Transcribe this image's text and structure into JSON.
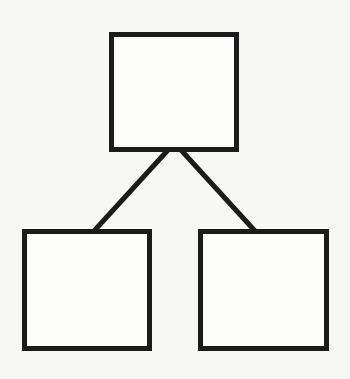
{
  "diagram": {
    "type": "tree",
    "width": 350,
    "height": 379,
    "background": "#f7f7f5",
    "stroke_color": "#1b1b1b",
    "fill_color": "#fdfdfc",
    "stroke_width": 5,
    "nodes": [
      {
        "id": "root",
        "label": "",
        "x": 111.5,
        "y": 34.5,
        "w": 125,
        "h": 115
      },
      {
        "id": "child-left",
        "label": "",
        "x": 24.5,
        "y": 231.5,
        "w": 125,
        "h": 117
      },
      {
        "id": "child-right",
        "label": "",
        "x": 200.5,
        "y": 231.5,
        "w": 126,
        "h": 117
      }
    ],
    "edges": [
      {
        "from": "root",
        "to": "child-left",
        "x1": 168,
        "y1": 150,
        "x2": 94,
        "y2": 231
      },
      {
        "from": "root",
        "to": "child-right",
        "x1": 181,
        "y1": 150,
        "x2": 255,
        "y2": 231
      }
    ]
  }
}
